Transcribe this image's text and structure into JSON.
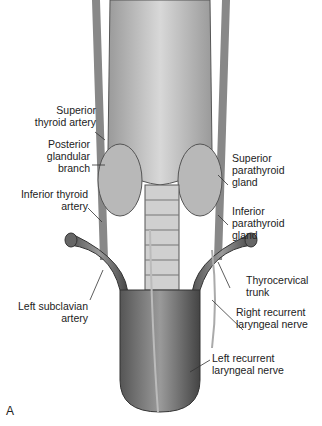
{
  "figure": {
    "panel_label": "A",
    "labels": {
      "superior_thyroid_artery": [
        "Superior",
        "thyroid artery"
      ],
      "posterior_glandular_branch": [
        "Posterior",
        "glandular",
        "branch"
      ],
      "superior_parathyroid_gland": [
        "Superior",
        "parathyroid",
        "gland"
      ],
      "inferior_thyroid_artery": [
        "Inferior thyroid",
        "artery"
      ],
      "inferior_parathyroid_gland": [
        "Inferior",
        "parathyroid",
        "gland"
      ],
      "thyrocervical_trunk": [
        "Thyrocervical",
        "trunk"
      ],
      "left_subclavian_artery": [
        "Left subclavian",
        "artery"
      ],
      "right_recurrent_laryngeal_nerve": [
        "Right recurrent",
        "laryngeal nerve"
      ],
      "left_recurrent_laryngeal_nerve": [
        "Left recurrent",
        "laryngeal nerve"
      ]
    }
  }
}
